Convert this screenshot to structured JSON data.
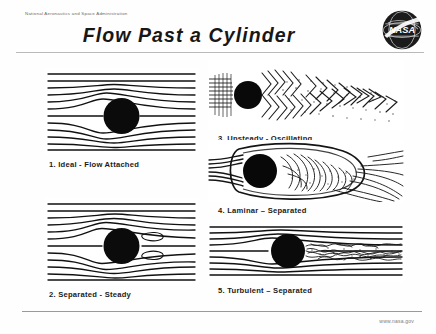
{
  "header": {
    "agency": "National Aeronautics and Space Administration",
    "title": "Flow Past a Cylinder",
    "logo_icon": "nasa-meatball-icon",
    "logo_text": "NASA"
  },
  "footer": {
    "url": "www.nasa.gov"
  },
  "panels": [
    {
      "number": "1.",
      "caption": "1.  Ideal - Flow Attached",
      "regime": "ideal",
      "description": "Symmetric attached streamlines, no wake",
      "figure_icon": "streamline-diagram-icon"
    },
    {
      "number": "2.",
      "caption": "2.  Separated - Steady",
      "regime": "separated-steady",
      "description": "Two closed standing recirculation eddies behind cylinder",
      "figure_icon": "streamline-diagram-icon"
    },
    {
      "number": "3.",
      "caption": "3.  Unsteady - Oscillating",
      "regime": "unsteady-oscillating",
      "description": "Von Karman vortex street shed alternately from cylinder",
      "figure_icon": "flow-visualization-photo-icon"
    },
    {
      "number": "4.",
      "caption": "4.  Laminar – Separated",
      "regime": "laminar-separated",
      "description": "Laminar boundary layer separates early, wide chaotic wake",
      "figure_icon": "flow-visualization-photo-icon"
    },
    {
      "number": "5.",
      "caption": "5.  Turbulent – Separated",
      "regime": "turbulent-separated",
      "description": "Turbulent boundary layer, late separation, narrow wake",
      "figure_icon": "flow-visualization-photo-icon"
    }
  ],
  "colors": {
    "ink": "#111111",
    "rule": "#b9b9b9",
    "muted": "#7d7d7d",
    "nasa_blue": "#1a1a1a"
  }
}
